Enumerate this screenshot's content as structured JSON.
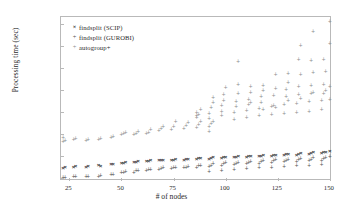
{
  "chart_data": {
    "type": "scatter",
    "title": "",
    "xlabel": "# of nodes",
    "ylabel": "Processing time (sec)",
    "yscale": "log",
    "xlim": [
      21,
      151
    ],
    "ylim": [
      0.007,
      200000
    ],
    "grid": false,
    "legend_position": "top-left",
    "xticks": [
      25,
      50,
      75,
      100,
      125,
      150
    ],
    "xtick_labels": [
      "25",
      "50",
      "75",
      "100",
      "125",
      "150"
    ],
    "yticks": [
      0.01,
      0.1,
      1,
      10,
      100,
      1000,
      10000,
      100000
    ],
    "ytick_labels": [
      "1 · 10⁻²",
      "0.1",
      "1",
      "10",
      "100",
      "1,000",
      "10,000",
      "1 · 10⁵"
    ],
    "series": [
      {
        "name": "findsplit (SCIP)",
        "marker": "x",
        "color": "#3a3a3a",
        "points": [
          [
            22,
            0.028
          ],
          [
            23,
            0.03
          ],
          [
            27,
            0.03
          ],
          [
            28,
            0.032
          ],
          [
            33,
            0.031
          ],
          [
            34,
            0.033
          ],
          [
            39,
            0.036
          ],
          [
            40,
            0.035
          ],
          [
            45,
            0.04
          ],
          [
            46,
            0.042
          ],
          [
            50,
            0.045
          ],
          [
            51,
            0.047
          ],
          [
            52,
            0.05
          ],
          [
            56,
            0.05
          ],
          [
            57,
            0.052
          ],
          [
            58,
            0.055
          ],
          [
            62,
            0.055
          ],
          [
            63,
            0.058
          ],
          [
            64,
            0.06
          ],
          [
            68,
            0.06
          ],
          [
            69,
            0.062
          ],
          [
            70,
            0.065
          ],
          [
            74,
            0.062
          ],
          [
            75,
            0.065
          ],
          [
            76,
            0.068
          ],
          [
            80,
            0.065
          ],
          [
            81,
            0.07
          ],
          [
            82,
            0.072
          ],
          [
            86,
            0.07
          ],
          [
            87,
            0.075
          ],
          [
            88,
            0.078
          ],
          [
            92,
            0.072
          ],
          [
            93,
            0.078
          ],
          [
            94,
            0.082
          ],
          [
            98,
            0.078
          ],
          [
            99,
            0.085
          ],
          [
            100,
            0.09
          ],
          [
            104,
            0.082
          ],
          [
            105,
            0.09
          ],
          [
            106,
            0.095
          ],
          [
            110,
            0.088
          ],
          [
            111,
            0.095
          ],
          [
            112,
            0.1
          ],
          [
            116,
            0.095
          ],
          [
            117,
            0.1
          ],
          [
            118,
            0.105
          ],
          [
            122,
            0.1
          ],
          [
            123,
            0.108
          ],
          [
            124,
            0.112
          ],
          [
            128,
            0.105
          ],
          [
            129,
            0.115
          ],
          [
            130,
            0.12
          ],
          [
            134,
            0.11
          ],
          [
            135,
            0.12
          ],
          [
            136,
            0.128
          ],
          [
            140,
            0.12
          ],
          [
            141,
            0.135
          ],
          [
            142,
            0.145
          ],
          [
            146,
            0.13
          ],
          [
            147,
            0.14
          ],
          [
            148,
            0.15
          ],
          [
            150,
            0.16
          ]
        ]
      },
      {
        "name": "findsplit (GUROBI)",
        "marker": "+",
        "color": "#555555",
        "points": [
          [
            22,
            0.0098
          ],
          [
            23,
            0.01
          ],
          [
            27,
            0.0102
          ],
          [
            28,
            0.0105
          ],
          [
            33,
            0.0105
          ],
          [
            34,
            0.011
          ],
          [
            39,
            0.011
          ],
          [
            40,
            0.0115
          ],
          [
            45,
            0.013
          ],
          [
            46,
            0.0135
          ],
          [
            50,
            0.016
          ],
          [
            51,
            0.017
          ],
          [
            52,
            0.018
          ],
          [
            56,
            0.017
          ],
          [
            57,
            0.019
          ],
          [
            58,
            0.02
          ],
          [
            62,
            0.02
          ],
          [
            63,
            0.022
          ],
          [
            64,
            0.023
          ],
          [
            68,
            0.022
          ],
          [
            69,
            0.024
          ],
          [
            70,
            0.026
          ],
          [
            74,
            0.024
          ],
          [
            75,
            0.026
          ],
          [
            76,
            0.028
          ],
          [
            80,
            0.026
          ],
          [
            81,
            0.028
          ],
          [
            82,
            0.03
          ],
          [
            86,
            0.028
          ],
          [
            87,
            0.032
          ],
          [
            88,
            0.035
          ],
          [
            92,
            0.03
          ],
          [
            93,
            0.035
          ],
          [
            94,
            0.04
          ],
          [
            98,
            0.034
          ],
          [
            99,
            0.04
          ],
          [
            100,
            0.045
          ],
          [
            104,
            0.036
          ],
          [
            105,
            0.042
          ],
          [
            106,
            0.048
          ],
          [
            110,
            0.04
          ],
          [
            111,
            0.046
          ],
          [
            112,
            0.052
          ],
          [
            116,
            0.042
          ],
          [
            117,
            0.05
          ],
          [
            118,
            0.058
          ],
          [
            122,
            0.045
          ],
          [
            123,
            0.055
          ],
          [
            124,
            0.062
          ],
          [
            128,
            0.05
          ],
          [
            129,
            0.058
          ],
          [
            130,
            0.066
          ],
          [
            134,
            0.052
          ],
          [
            135,
            0.06
          ],
          [
            136,
            0.07
          ],
          [
            140,
            0.055
          ],
          [
            141,
            0.065
          ],
          [
            142,
            0.075
          ],
          [
            146,
            0.058
          ],
          [
            147,
            0.068
          ],
          [
            148,
            0.08
          ],
          [
            150,
            0.085
          ],
          [
            92,
            0.018
          ],
          [
            98,
            0.02
          ],
          [
            104,
            0.022
          ],
          [
            110,
            0.024
          ],
          [
            116,
            0.026
          ],
          [
            122,
            0.028
          ],
          [
            128,
            0.03
          ],
          [
            134,
            0.032
          ],
          [
            140,
            0.034
          ],
          [
            146,
            0.036
          ]
        ]
      },
      {
        "name": "autogroup+",
        "marker": "+",
        "color": "#8e8e8e",
        "points": [
          [
            22,
            0.42
          ],
          [
            22,
            0.6
          ],
          [
            23,
            0.45
          ],
          [
            27,
            0.5
          ],
          [
            28,
            0.55
          ],
          [
            33,
            0.45
          ],
          [
            34,
            0.5
          ],
          [
            39,
            0.5
          ],
          [
            40,
            0.55
          ],
          [
            45,
            0.6
          ],
          [
            46,
            0.7
          ],
          [
            50,
            0.85
          ],
          [
            51,
            0.95
          ],
          [
            52,
            1.1
          ],
          [
            56,
            0.9
          ],
          [
            57,
            1.0
          ],
          [
            58,
            1.2
          ],
          [
            62,
            0.95
          ],
          [
            63,
            1.1
          ],
          [
            64,
            1.4
          ],
          [
            68,
            1.3
          ],
          [
            69,
            1.6
          ],
          [
            70,
            2.0
          ],
          [
            74,
            1.5
          ],
          [
            75,
            2.0
          ],
          [
            76,
            3.2
          ],
          [
            80,
            1.6
          ],
          [
            81,
            2.2
          ],
          [
            82,
            3.0
          ],
          [
            86,
            1.8
          ],
          [
            87,
            2.5
          ],
          [
            88,
            3.5
          ],
          [
            92,
            1.9
          ],
          [
            93,
            2.6
          ],
          [
            94,
            3.4
          ],
          [
            86,
            5.0
          ],
          [
            86,
            6.5
          ],
          [
            86,
            9.0
          ],
          [
            87,
            7.0
          ],
          [
            88,
            12
          ],
          [
            92,
            1.2
          ],
          [
            92,
            4.5
          ],
          [
            92,
            8
          ],
          [
            93,
            14
          ],
          [
            94,
            25
          ],
          [
            94,
            40
          ],
          [
            98,
            6
          ],
          [
            98,
            10
          ],
          [
            98,
            18
          ],
          [
            99,
            30
          ],
          [
            99,
            55
          ],
          [
            100,
            120
          ],
          [
            104,
            4
          ],
          [
            104,
            9
          ],
          [
            105,
            16
          ],
          [
            105,
            28
          ],
          [
            106,
            60
          ],
          [
            106,
            1800
          ],
          [
            110,
            5
          ],
          [
            110,
            11
          ],
          [
            111,
            20
          ],
          [
            111,
            35
          ],
          [
            112,
            70
          ],
          [
            112,
            130
          ],
          [
            116,
            6
          ],
          [
            116,
            13
          ],
          [
            117,
            24
          ],
          [
            117,
            45
          ],
          [
            118,
            90
          ],
          [
            118,
            140
          ],
          [
            122,
            7
          ],
          [
            122,
            16
          ],
          [
            123,
            18
          ],
          [
            123,
            50
          ],
          [
            124,
            110
          ],
          [
            124,
            450
          ],
          [
            128,
            8
          ],
          [
            128,
            20
          ],
          [
            129,
            45
          ],
          [
            129,
            95
          ],
          [
            130,
            200
          ],
          [
            130,
            500
          ],
          [
            134,
            9
          ],
          [
            134,
            22
          ],
          [
            135,
            55
          ],
          [
            135,
            130
          ],
          [
            135,
            2200
          ],
          [
            136,
            480
          ],
          [
            136,
            9500
          ],
          [
            140,
            10
          ],
          [
            140,
            26
          ],
          [
            141,
            60
          ],
          [
            141,
            150
          ],
          [
            141,
            2000
          ],
          [
            142,
            550
          ],
          [
            142,
            40000
          ],
          [
            146,
            12
          ],
          [
            146,
            30
          ],
          [
            147,
            65
          ],
          [
            147,
            170
          ],
          [
            147,
            2300
          ],
          [
            148,
            600
          ],
          [
            150,
            35
          ],
          [
            150,
            130
          ],
          [
            150,
            12000
          ],
          [
            150,
            120000
          ],
          [
            106,
            160
          ],
          [
            112,
            25
          ],
          [
            118,
            12
          ],
          [
            124,
            14
          ],
          [
            130,
            30
          ],
          [
            136,
            38
          ],
          [
            142,
            70
          ],
          [
            148,
            90
          ]
        ]
      }
    ]
  },
  "legend": {
    "entries": [
      {
        "marker": "×",
        "label": "findsplit (SCIP)"
      },
      {
        "marker": "+",
        "label": "findsplit (GUROBI)"
      },
      {
        "marker": "+",
        "label": "autogroup+"
      }
    ]
  },
  "axes": {
    "y_title": "Processing time (sec)",
    "x_title": "# of nodes"
  },
  "colors": {
    "frame": "#b9b9b9",
    "text": "#2b2b2b",
    "scip": "#3a3a3a",
    "gurobi": "#555555",
    "autogroup": "#8e8e8e"
  }
}
